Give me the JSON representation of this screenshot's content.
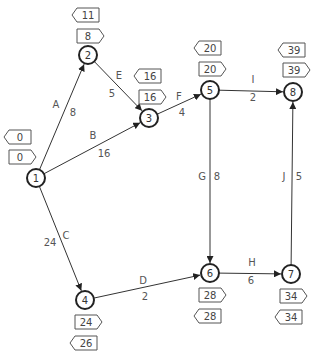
{
  "diagram": {
    "type": "activity-on-arrow network",
    "nodes": [
      {
        "id": "1",
        "label": "1",
        "x": 36,
        "y": 178,
        "earliest": "0",
        "latest": "0",
        "earliest_box": {
          "x": 20,
          "y": 157,
          "dir": "right"
        },
        "latest_box": {
          "x": 20,
          "y": 137,
          "dir": "left"
        }
      },
      {
        "id": "2",
        "label": "2",
        "x": 88,
        "y": 55,
        "earliest": "8",
        "latest": "11",
        "earliest_box": {
          "x": 88,
          "y": 36,
          "dir": "right"
        },
        "latest_box": {
          "x": 88,
          "y": 15,
          "dir": "left"
        }
      },
      {
        "id": "3",
        "label": "3",
        "x": 149,
        "y": 118,
        "earliest": "16",
        "latest": "16",
        "earliest_box": {
          "x": 150,
          "y": 97,
          "dir": "right"
        },
        "latest_box": {
          "x": 150,
          "y": 76,
          "dir": "left"
        }
      },
      {
        "id": "4",
        "label": "4",
        "x": 85,
        "y": 300,
        "earliest": "24",
        "latest": "26",
        "earliest_box": {
          "x": 86,
          "y": 322,
          "dir": "right"
        },
        "latest_box": {
          "x": 86,
          "y": 343,
          "dir": "left"
        }
      },
      {
        "id": "5",
        "label": "5",
        "x": 210,
        "y": 90,
        "earliest": "20",
        "latest": "20",
        "earliest_box": {
          "x": 210,
          "y": 69,
          "dir": "right"
        },
        "latest_box": {
          "x": 210,
          "y": 48,
          "dir": "left"
        }
      },
      {
        "id": "6",
        "label": "6",
        "x": 210,
        "y": 273,
        "earliest": "28",
        "latest": "28",
        "earliest_box": {
          "x": 210,
          "y": 295,
          "dir": "right"
        },
        "latest_box": {
          "x": 210,
          "y": 316,
          "dir": "left"
        }
      },
      {
        "id": "7",
        "label": "7",
        "x": 291,
        "y": 274,
        "earliest": "34",
        "latest": "34",
        "earliest_box": {
          "x": 291,
          "y": 296,
          "dir": "right"
        },
        "latest_box": {
          "x": 291,
          "y": 317,
          "dir": "left"
        }
      },
      {
        "id": "8",
        "label": "8",
        "x": 293,
        "y": 92,
        "earliest": "39",
        "latest": "39",
        "earliest_box": {
          "x": 294,
          "y": 70,
          "dir": "right"
        },
        "latest_box": {
          "x": 294,
          "y": 50,
          "dir": "left"
        }
      }
    ],
    "edges": [
      {
        "from": "1",
        "to": "2",
        "activity": "A",
        "duration": "8",
        "letter_pos": {
          "x": 56,
          "y": 108
        },
        "weight_pos": {
          "x": 73,
          "y": 116
        }
      },
      {
        "from": "1",
        "to": "3",
        "activity": "B",
        "duration": "16",
        "letter_pos": {
          "x": 93,
          "y": 139
        },
        "weight_pos": {
          "x": 104,
          "y": 157
        }
      },
      {
        "from": "1",
        "to": "4",
        "activity": "C",
        "duration": "24",
        "letter_pos": {
          "x": 66,
          "y": 239
        },
        "weight_pos": {
          "x": 50,
          "y": 246
        }
      },
      {
        "from": "2",
        "to": "3",
        "activity": "E",
        "duration": "5",
        "letter_pos": {
          "x": 119,
          "y": 79
        },
        "weight_pos": {
          "x": 112,
          "y": 97
        }
      },
      {
        "from": "3",
        "to": "5",
        "activity": "F",
        "duration": "4",
        "letter_pos": {
          "x": 179,
          "y": 100
        },
        "weight_pos": {
          "x": 182,
          "y": 116
        }
      },
      {
        "from": "5",
        "to": "8",
        "activity": "I",
        "duration": "2",
        "letter_pos": {
          "x": 253,
          "y": 83
        },
        "weight_pos": {
          "x": 253,
          "y": 101
        }
      },
      {
        "from": "5",
        "to": "6",
        "activity": "G",
        "duration": "8",
        "letter_pos": {
          "x": 202,
          "y": 180
        },
        "weight_pos": {
          "x": 217,
          "y": 180
        }
      },
      {
        "from": "7",
        "to": "8",
        "activity": "J",
        "duration": "5",
        "letter_pos": {
          "x": 284,
          "y": 180
        },
        "weight_pos": {
          "x": 299,
          "y": 180
        }
      },
      {
        "from": "4",
        "to": "6",
        "activity": "D",
        "duration": "2",
        "letter_pos": {
          "x": 143,
          "y": 284
        },
        "weight_pos": {
          "x": 145,
          "y": 300
        }
      },
      {
        "from": "6",
        "to": "7",
        "activity": "H",
        "duration": "6",
        "letter_pos": {
          "x": 252,
          "y": 266
        },
        "weight_pos": {
          "x": 251,
          "y": 284
        }
      }
    ]
  },
  "colors": {
    "node_stroke": "#222222",
    "edge_stroke": "#333333",
    "text": "#4a4a4a",
    "background": "#ffffff"
  }
}
